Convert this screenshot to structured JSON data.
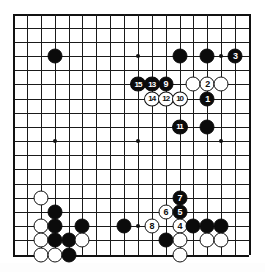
{
  "diagram": {
    "kind": "go-board-diagram",
    "board_size": 18,
    "title": "",
    "colors": {
      "black_stone": "#0b0b0b",
      "white_stone": "#ffffff",
      "line": "#1a1a1a",
      "background": "#ffffff",
      "black_number_text": "#ffffff",
      "white_number_text": "#101010"
    },
    "star_points": [
      {
        "col": 3,
        "row": 3
      },
      {
        "col": 9,
        "row": 3
      },
      {
        "col": 15,
        "row": 3
      },
      {
        "col": 3,
        "row": 9
      },
      {
        "col": 9,
        "row": 9
      },
      {
        "col": 15,
        "row": 9
      },
      {
        "col": 3,
        "row": 15
      },
      {
        "col": 9,
        "row": 15
      },
      {
        "col": 15,
        "row": 15
      }
    ],
    "stones": [
      {
        "col": 3,
        "row": 3,
        "color": "black",
        "label": ""
      },
      {
        "col": 12,
        "row": 3,
        "color": "black",
        "label": ""
      },
      {
        "col": 14,
        "row": 3,
        "color": "black",
        "label": ""
      },
      {
        "col": 16,
        "row": 3,
        "color": "black",
        "label": "3"
      },
      {
        "col": 9,
        "row": 5,
        "color": "black",
        "label": "15"
      },
      {
        "col": 10,
        "row": 5,
        "color": "black",
        "label": "13"
      },
      {
        "col": 11,
        "row": 5,
        "color": "black",
        "label": "9"
      },
      {
        "col": 13,
        "row": 5,
        "color": "white",
        "label": ""
      },
      {
        "col": 14,
        "row": 5,
        "color": "white",
        "label": "2"
      },
      {
        "col": 15,
        "row": 5,
        "color": "white",
        "label": ""
      },
      {
        "col": 10,
        "row": 6,
        "color": "white",
        "label": "14"
      },
      {
        "col": 11,
        "row": 6,
        "color": "white",
        "label": "12"
      },
      {
        "col": 12,
        "row": 6,
        "color": "white",
        "label": "10"
      },
      {
        "col": 14,
        "row": 6,
        "color": "black",
        "label": "1"
      },
      {
        "col": 12,
        "row": 8,
        "color": "black",
        "label": "11"
      },
      {
        "col": 14,
        "row": 8,
        "color": "black",
        "label": ""
      },
      {
        "col": 2,
        "row": 13,
        "color": "white",
        "label": ""
      },
      {
        "col": 3,
        "row": 14,
        "color": "black",
        "label": ""
      },
      {
        "col": 12,
        "row": 13,
        "color": "black",
        "label": "7"
      },
      {
        "col": 11,
        "row": 14,
        "color": "white",
        "label": "6"
      },
      {
        "col": 12,
        "row": 14,
        "color": "black",
        "label": "5"
      },
      {
        "col": 2,
        "row": 15,
        "color": "white",
        "label": ""
      },
      {
        "col": 3,
        "row": 15,
        "color": "black",
        "label": ""
      },
      {
        "col": 5,
        "row": 15,
        "color": "black",
        "label": ""
      },
      {
        "col": 8,
        "row": 15,
        "color": "black",
        "label": ""
      },
      {
        "col": 10,
        "row": 15,
        "color": "white",
        "label": "8"
      },
      {
        "col": 12,
        "row": 15,
        "color": "white",
        "label": "4"
      },
      {
        "col": 13,
        "row": 15,
        "color": "black",
        "label": ""
      },
      {
        "col": 14,
        "row": 15,
        "color": "black",
        "label": ""
      },
      {
        "col": 15,
        "row": 15,
        "color": "black",
        "label": ""
      },
      {
        "col": 2,
        "row": 16,
        "color": "white",
        "label": ""
      },
      {
        "col": 3,
        "row": 16,
        "color": "black",
        "label": ""
      },
      {
        "col": 4,
        "row": 16,
        "color": "black",
        "label": ""
      },
      {
        "col": 5,
        "row": 16,
        "color": "white",
        "label": ""
      },
      {
        "col": 11,
        "row": 16,
        "color": "black",
        "label": ""
      },
      {
        "col": 12,
        "row": 16,
        "color": "white",
        "label": ""
      },
      {
        "col": 14,
        "row": 16,
        "color": "white",
        "label": ""
      },
      {
        "col": 15,
        "row": 16,
        "color": "white",
        "label": ""
      },
      {
        "col": 2,
        "row": 17,
        "color": "white",
        "label": ""
      },
      {
        "col": 3,
        "row": 17,
        "color": "white",
        "label": ""
      },
      {
        "col": 4,
        "row": 17,
        "color": "black",
        "label": ""
      },
      {
        "col": 12,
        "row": 17,
        "color": "white",
        "label": ""
      }
    ],
    "move_numbers": [
      "1",
      "2",
      "3",
      "4",
      "5",
      "6",
      "7",
      "8",
      "9",
      "10",
      "11",
      "12",
      "13",
      "14",
      "15"
    ]
  }
}
